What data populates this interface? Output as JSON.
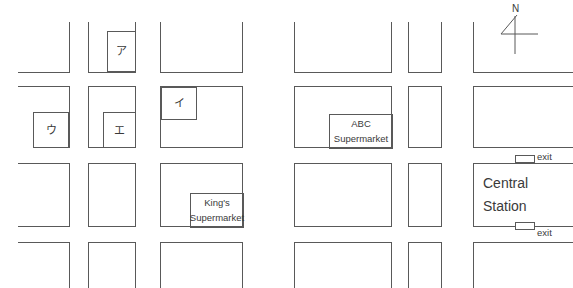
{
  "map": {
    "type": "street-map",
    "width": 573,
    "height": 288,
    "background_color": "#ffffff",
    "line_color": "#595959",
    "text_color": "#3a3a3a",
    "description": "Schematic street map grid of six block columns and four block rows separated by streets, with four kana-labelled parcels, two supermarkets, and a train station with two exits."
  },
  "compass": {
    "label": "N",
    "direction": "north-up"
  },
  "kana_parcels": [
    {
      "label": "ア",
      "romaji": "a",
      "block": "col2-row1",
      "position": "upper-right"
    },
    {
      "label": "イ",
      "romaji": "i",
      "block": "col3-row2",
      "position": "upper-left"
    },
    {
      "label": "ウ",
      "romaji": "u",
      "block": "col1-row2",
      "position": "lower-right"
    },
    {
      "label": "エ",
      "romaji": "e",
      "block": "col2-row2",
      "position": "lower-right"
    }
  ],
  "landmarks": [
    {
      "name": "ABC Supermarket",
      "line1": "ABC",
      "line2": "Supermarket",
      "block": "col4-row2",
      "position": "lower-right"
    },
    {
      "name": "King's Supermarket",
      "line1": "King's",
      "line2": "Supermarket",
      "block": "col3-row3",
      "position": "lower-right"
    }
  ],
  "station": {
    "line1": "Central",
    "line2": "Station",
    "block": "col6-row3",
    "exits": [
      {
        "label": "exit",
        "side": "north"
      },
      {
        "label": "exit",
        "side": "south"
      }
    ]
  }
}
